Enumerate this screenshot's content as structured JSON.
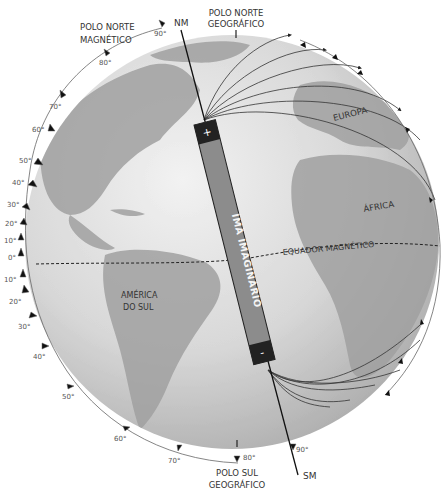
{
  "labels": {
    "north_magnetic_pole": [
      "POLO NORTE",
      "MAGNÉTICO"
    ],
    "north_geographic_pole": [
      "POLO NORTE",
      "GEOGRÁFICO"
    ],
    "south_geographic_pole": [
      "POLO SUL",
      "GEOGRÁFICO"
    ],
    "nm": "NM",
    "sm": "SM",
    "europe": "EUROPA",
    "africa": "ÁFRICA",
    "south_america": [
      "AMÉRICA",
      "DO SUL"
    ],
    "magnetic_equator": "EQUADOR MAGNÉTICO",
    "magnet": "ÍMÃ IMAGINÁRIO",
    "magnet_plus": "+",
    "magnet_minus": "-"
  },
  "inclination_scale": {
    "upper": [
      "90°",
      "80°",
      "70°",
      "60°",
      "50°",
      "40°",
      "30°",
      "20°",
      "10°",
      "0°"
    ],
    "lower": [
      "10°",
      "20°",
      "30°",
      "40°",
      "50°",
      "60°",
      "70°",
      "80°"
    ],
    "south_end": "90°"
  },
  "colors": {
    "ocean": "#d9d9d9",
    "land": "#9e9e9e",
    "magnet_body": "#8a8a8a",
    "magnet_caps": "#222222",
    "lines": "#333333"
  }
}
